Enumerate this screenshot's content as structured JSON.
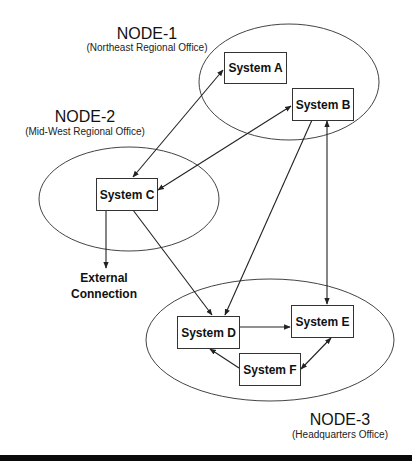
{
  "nodes": [
    {
      "id": "node-1",
      "title": "NODE-1",
      "subtitle": "(Northeast Regional Office)"
    },
    {
      "id": "node-2",
      "title": "NODE-2",
      "subtitle": "(Mid-West Regional Office)"
    },
    {
      "id": "node-3",
      "title": "NODE-3",
      "subtitle": "(Headquarters Office)"
    }
  ],
  "systems": {
    "a": "System A",
    "b": "System B",
    "c": "System C",
    "d": "System D",
    "e": "System E",
    "f": "System F"
  },
  "external": {
    "line1": "External",
    "line2": "Connection"
  },
  "edges": [
    {
      "from": "System A",
      "to": "System C",
      "direction": "bidirectional"
    },
    {
      "from": "System B",
      "to": "System C",
      "direction": "bidirectional"
    },
    {
      "from": "System B",
      "to": "System D",
      "direction": "one-way"
    },
    {
      "from": "System B",
      "to": "System E",
      "direction": "bidirectional"
    },
    {
      "from": "System C",
      "to": "System D",
      "direction": "one-way"
    },
    {
      "from": "System C",
      "to": "External Connection",
      "direction": "one-way"
    },
    {
      "from": "System D",
      "to": "System E",
      "direction": "one-way"
    },
    {
      "from": "System F",
      "to": "System D",
      "direction": "one-way"
    },
    {
      "from": "System E",
      "to": "System F",
      "direction": "bidirectional"
    }
  ],
  "colors": {
    "stroke": "#333333",
    "text": "#111111",
    "background": "#ffffff"
  }
}
